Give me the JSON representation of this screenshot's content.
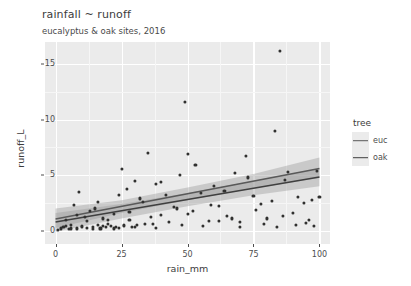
{
  "chart_data": {
    "type": "scatter",
    "title": "rainfall ~ runoff",
    "subtitle": "eucalyptus & oak sites, 2016",
    "xlabel": "rain_mm",
    "ylabel": "runoff_L",
    "xlim": [
      -4,
      104
    ],
    "ylim": [
      -1.2,
      17.0
    ],
    "xticks": [
      0,
      25,
      50,
      75,
      100
    ],
    "yticks": [
      0,
      5,
      10,
      15
    ],
    "grid": true,
    "legend": {
      "title": "tree",
      "position": "right",
      "entries": [
        {
          "label": "euc",
          "color": "#595959"
        },
        {
          "label": "oak",
          "color": "#3f3f3f"
        }
      ]
    },
    "point_color": "#30302f",
    "band_color": "#9a9a9a",
    "panel_bg": "#ebebeb",
    "series": [
      {
        "name": "euc",
        "fit": {
          "intercept": 1.05,
          "slope": 0.0455
        },
        "band_upper": [
          [
            0,
            2.0
          ],
          [
            25,
            2.75
          ],
          [
            50,
            3.9
          ],
          [
            75,
            5.1
          ],
          [
            100,
            6.6
          ]
        ],
        "band_lower": [
          [
            0,
            0.25
          ],
          [
            25,
            1.6
          ],
          [
            50,
            2.75
          ],
          [
            75,
            3.8
          ],
          [
            100,
            4.75
          ]
        ],
        "points": [
          [
            2,
            0.2
          ],
          [
            3,
            0.35
          ],
          [
            4,
            1.0
          ],
          [
            5,
            0.15
          ],
          [
            6,
            0.5
          ],
          [
            7,
            2.3
          ],
          [
            8,
            0.2
          ],
          [
            9,
            3.5
          ],
          [
            10,
            0.4
          ],
          [
            11,
            1.2
          ],
          [
            12,
            0.25
          ],
          [
            13,
            1.8
          ],
          [
            14,
            0.3
          ],
          [
            15,
            2.0
          ],
          [
            16,
            0.5
          ],
          [
            17,
            0.2
          ],
          [
            18,
            1.1
          ],
          [
            19,
            0.35
          ],
          [
            20,
            0.6
          ],
          [
            21,
            0.45
          ],
          [
            22,
            1.5
          ],
          [
            23,
            0.3
          ],
          [
            24,
            0.25
          ],
          [
            25,
            5.6
          ],
          [
            26,
            0.4
          ],
          [
            27,
            3.8
          ],
          [
            28,
            1.0
          ],
          [
            29,
            0.3
          ],
          [
            30,
            4.5
          ],
          [
            31,
            0.5
          ],
          [
            33,
            2.6
          ],
          [
            35,
            7.0
          ],
          [
            37,
            0.6
          ],
          [
            38,
            4.2
          ],
          [
            40,
            1.4
          ],
          [
            42,
            3.2
          ],
          [
            45,
            2.1
          ],
          [
            47,
            5.0
          ],
          [
            49,
            11.6
          ],
          [
            50,
            6.9
          ],
          [
            52,
            1.8
          ],
          [
            55,
            3.4
          ],
          [
            58,
            0.9
          ],
          [
            60,
            4.0
          ],
          [
            62,
            2.2
          ],
          [
            65,
            1.3
          ],
          [
            68,
            5.2
          ],
          [
            70,
            0.8
          ],
          [
            72,
            6.7
          ],
          [
            75,
            3.1
          ],
          [
            78,
            2.4
          ],
          [
            80,
            1.1
          ],
          [
            83,
            9.0
          ],
          [
            85,
            16.2
          ],
          [
            87,
            4.6
          ],
          [
            90,
            1.6
          ],
          [
            92,
            3.0
          ],
          [
            95,
            0.7
          ],
          [
            97,
            2.8
          ],
          [
            99,
            5.4
          ]
        ]
      },
      {
        "name": "oak",
        "fit": {
          "intercept": 0.78,
          "slope": 0.0405
        },
        "band_upper": [
          [
            0,
            1.6
          ],
          [
            25,
            2.4
          ],
          [
            50,
            3.4
          ],
          [
            75,
            4.5
          ],
          [
            100,
            5.6
          ]
        ],
        "band_lower": [
          [
            0,
            -0.1
          ],
          [
            25,
            1.1
          ],
          [
            50,
            2.2
          ],
          [
            75,
            3.2
          ],
          [
            100,
            4.0
          ]
        ],
        "points": [
          [
            1,
            0.1
          ],
          [
            4,
            0.45
          ],
          [
            6,
            0.2
          ],
          [
            8,
            1.4
          ],
          [
            10,
            0.3
          ],
          [
            12,
            0.9
          ],
          [
            14,
            0.15
          ],
          [
            16,
            2.6
          ],
          [
            18,
            0.4
          ],
          [
            20,
            1.0
          ],
          [
            22,
            0.2
          ],
          [
            24,
            3.2
          ],
          [
            26,
            0.5
          ],
          [
            28,
            1.7
          ],
          [
            30,
            0.35
          ],
          [
            32,
            2.9
          ],
          [
            34,
            0.6
          ],
          [
            36,
            1.2
          ],
          [
            38,
            0.25
          ],
          [
            40,
            4.4
          ],
          [
            43,
            0.8
          ],
          [
            46,
            2.0
          ],
          [
            48,
            0.5
          ],
          [
            50,
            1.5
          ],
          [
            53,
            5.9
          ],
          [
            56,
            0.4
          ],
          [
            59,
            2.3
          ],
          [
            62,
            0.9
          ],
          [
            64,
            3.6
          ],
          [
            67,
            1.1
          ],
          [
            70,
            0.3
          ],
          [
            73,
            4.8
          ],
          [
            76,
            1.9
          ],
          [
            79,
            0.6
          ],
          [
            82,
            2.7
          ],
          [
            84,
            0.35
          ],
          [
            86,
            1.3
          ],
          [
            88,
            5.3
          ],
          [
            91,
            0.5
          ],
          [
            94,
            2.5
          ],
          [
            96,
            1.0
          ],
          [
            98,
            0.4
          ],
          [
            100,
            3.0
          ]
        ]
      }
    ]
  }
}
